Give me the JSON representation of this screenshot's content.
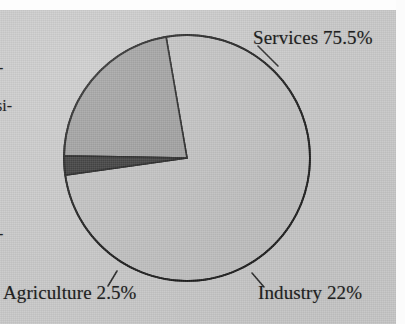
{
  "figure": {
    "kind": "scanned-pie-chart",
    "background_color": "#c8c8c8",
    "gutter_color": "#fdfdfd",
    "outline_color": "#1a1a1a"
  },
  "labels": {
    "services": "Services 75.5%",
    "industry": "Industry 22%",
    "agriculture": "Agriculture 2.5%"
  },
  "margin_fragments": {
    "frag_1": "-",
    "frag_2": "si-",
    "frag_3": "-"
  },
  "chart_data": {
    "type": "pie",
    "title": "",
    "categories": [
      "Services",
      "Industry",
      "Agriculture"
    ],
    "values": [
      75.5,
      22.0,
      2.5
    ],
    "value_unit": "%",
    "data_labels": [
      "Services 75.5%",
      "Industry 22%",
      "Agriculture 2.5%"
    ],
    "colors": [
      "#c0c0c0",
      "#9b9b9b",
      "#343434"
    ],
    "slice_edge_color": "#1a1a1a",
    "legend": "none",
    "grid": false,
    "annotations": [
      {
        "text": "Services 75.5%",
        "leader_line": true,
        "points_to": "services-slice-upper-right-rim"
      },
      {
        "text": "Industry 22%",
        "leader_line": true,
        "points_to": "industry-slice-lower-right-rim"
      },
      {
        "text": "Agriculture 2.5%",
        "leader_line": true,
        "points_to": "agriculture-slice-lower-left-rim"
      }
    ],
    "geometry": {
      "center_x": 187,
      "center_y": 158,
      "radius": 123,
      "start_angle_deg": 188,
      "direction": "counterclockwise"
    }
  }
}
